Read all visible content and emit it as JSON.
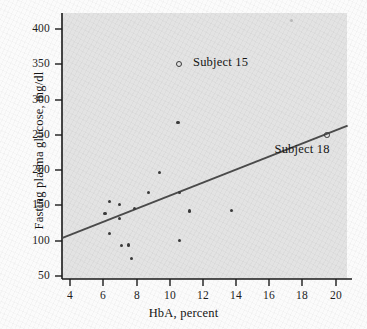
{
  "chart_data": {
    "type": "scatter",
    "title": "",
    "xlabel": "HbA, percent",
    "ylabel": "Fasting plasma glucose, mg/dl",
    "xlim": [
      3.5,
      20.8
    ],
    "ylim": [
      45,
      425
    ],
    "xticks": [
      4,
      6,
      8,
      10,
      12,
      14,
      16,
      18,
      20
    ],
    "yticks": [
      50,
      100,
      150,
      200,
      250,
      300,
      350,
      400
    ],
    "xtick_labels": [
      "4",
      "6",
      "8",
      "10",
      "12",
      "14",
      "16",
      "18",
      "20"
    ],
    "ytick_labels": [
      "50",
      "100",
      "150",
      "200",
      "250",
      "300",
      "350",
      "400"
    ],
    "grid": false,
    "legend": "none",
    "marker_color": "#3a3a3a",
    "line_color": "#4a4a4a",
    "plot_background": "#e3e3e3",
    "points": [
      {
        "x": 6.1,
        "y": 139,
        "style": "filled"
      },
      {
        "x": 6.4,
        "y": 155,
        "style": "filled"
      },
      {
        "x": 6.4,
        "y": 110,
        "style": "filled"
      },
      {
        "x": 7.0,
        "y": 151,
        "style": "filled"
      },
      {
        "x": 7.0,
        "y": 132,
        "style": "filled"
      },
      {
        "x": 7.1,
        "y": 93,
        "style": "filled"
      },
      {
        "x": 7.5,
        "y": 94,
        "style": "filled"
      },
      {
        "x": 7.7,
        "y": 75,
        "style": "filled"
      },
      {
        "x": 7.9,
        "y": 146,
        "style": "filled"
      },
      {
        "x": 8.7,
        "y": 168,
        "style": "filled"
      },
      {
        "x": 9.4,
        "y": 197,
        "style": "filled"
      },
      {
        "x": 10.5,
        "y": 267,
        "style": "filled"
      },
      {
        "x": 10.6,
        "y": 168,
        "style": "filled"
      },
      {
        "x": 10.6,
        "y": 100,
        "style": "filled"
      },
      {
        "x": 11.2,
        "y": 142,
        "style": "filled"
      },
      {
        "x": 13.7,
        "y": 143,
        "style": "filled"
      },
      {
        "x": 17.3,
        "y": 412,
        "style": "faint"
      },
      {
        "x": 19.4,
        "y": 251,
        "style": "open"
      }
    ],
    "fit_line": {
      "x1": 3.55,
      "y1": 104,
      "x2": 20.7,
      "y2": 263
    },
    "annotations": [
      {
        "name": "subject-15",
        "text": "Subject 15",
        "marker_x": 10.5,
        "marker_y": 352,
        "label_x": 11.4,
        "label_y": 352
      },
      {
        "name": "subject-18",
        "text": "Subject 18",
        "label_x": 16.3,
        "label_y": 229
      }
    ]
  }
}
